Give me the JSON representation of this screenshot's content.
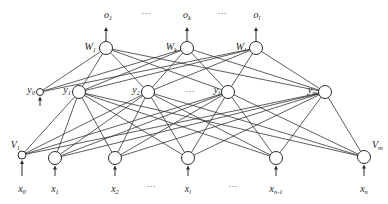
{
  "diagram": {
    "type": "neural-network",
    "outputs": [
      {
        "base": "o",
        "sub": "1"
      },
      {
        "base": "o",
        "sub": "k"
      },
      {
        "base": "o",
        "sub": "l"
      }
    ],
    "output_nodes": [
      {
        "base": "W",
        "sub": "1"
      },
      {
        "base": "W",
        "sub": "k"
      },
      {
        "base": "W",
        "sub": "l"
      }
    ],
    "hidden_bias": {
      "base": "y",
      "sub": "0"
    },
    "hidden_nodes": [
      {
        "base": "y",
        "sub": "1"
      },
      {
        "base": "y",
        "sub": "2"
      },
      {
        "base": "y",
        "sub": "j"
      },
      {
        "base": "y",
        "sub": "m"
      }
    ],
    "input_nodes": [
      {
        "base": "V",
        "sub": "1",
        "input": {
          "base": "x",
          "sub": "0"
        },
        "bias": true
      },
      {
        "base": "",
        "sub": "",
        "input": {
          "base": "x",
          "sub": "1"
        }
      },
      {
        "base": "",
        "sub": "",
        "input": {
          "base": "x",
          "sub": "2"
        }
      },
      {
        "base": "",
        "sub": "",
        "input": {
          "base": "x",
          "sub": "i"
        }
      },
      {
        "base": "",
        "sub": "",
        "input": {
          "base": "x",
          "sub": "n-1"
        }
      },
      {
        "base": "V",
        "sub": "m",
        "input": {
          "base": "x",
          "sub": "n"
        }
      }
    ],
    "ellipsis": "···"
  }
}
